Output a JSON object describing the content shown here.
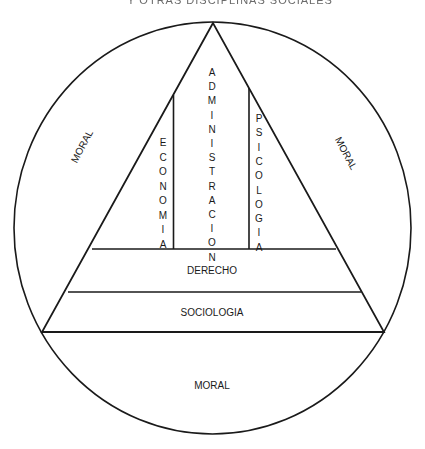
{
  "title_fragment": "Y OTRAS DISCIPLINAS SOCIALES",
  "colors": {
    "line": "#1a1a1a",
    "background": "#ffffff",
    "text": "#1a1a1a"
  },
  "outer_region": {
    "shape": "circle",
    "labels": {
      "left": "MORAL",
      "right": "MORAL",
      "bottom": "MORAL"
    }
  },
  "pyramid": {
    "shape": "triangle",
    "columns": [
      {
        "label": "ECONOMIA",
        "letters": [
          "E",
          "C",
          "O",
          "N",
          "O",
          "M",
          "I",
          "A"
        ]
      },
      {
        "label": "ADMINISTRACION",
        "letters": [
          "A",
          "D",
          "M",
          "I",
          "N",
          "I",
          "S",
          "T",
          "R",
          "A",
          "C",
          "I",
          "O",
          "N"
        ]
      },
      {
        "label": "PSICOLOGIA",
        "letters": [
          "P",
          "S",
          "I",
          "C",
          "O",
          "L",
          "O",
          "G",
          "I",
          "A"
        ]
      }
    ],
    "bands": [
      {
        "label": "DERECHO"
      },
      {
        "label": "SOCIOLOGIA"
      }
    ]
  }
}
